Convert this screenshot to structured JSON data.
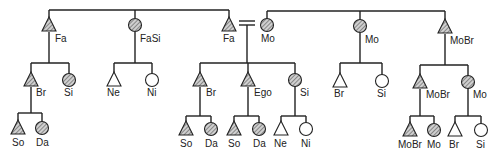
{
  "diagram": {
    "legend": {
      "triangle": "male",
      "circle": "female",
      "hatched": "consanguineal relative",
      "open": "not shaded",
      "equals": "marriage"
    },
    "colors": {
      "line": "#222222",
      "fill_hatch": "#888888",
      "background": "#ffffff"
    },
    "nodes": [
      {
        "id": "fa_left",
        "label": "Fa",
        "shape": "triangle",
        "fill": "hatched",
        "x": 49,
        "y": 25,
        "lx": 55,
        "ly": 42
      },
      {
        "id": "fasi",
        "label": "FaSi",
        "shape": "circle",
        "fill": "hatched",
        "x": 135,
        "y": 25,
        "lx": 140,
        "ly": 42
      },
      {
        "id": "fa_center",
        "label": "Fa",
        "shape": "triangle",
        "fill": "hatched",
        "x": 229,
        "y": 25,
        "lx": 223,
        "ly": 42
      },
      {
        "id": "mo_center",
        "label": "Mo",
        "shape": "circle",
        "fill": "hatched",
        "x": 267,
        "y": 25,
        "lx": 261,
        "ly": 42
      },
      {
        "id": "mo_right",
        "label": "Mo",
        "shape": "circle",
        "fill": "hatched",
        "x": 360,
        "y": 26,
        "lx": 365,
        "ly": 43
      },
      {
        "id": "mobr",
        "label": "MoBr",
        "shape": "triangle",
        "fill": "hatched",
        "x": 445,
        "y": 27,
        "lx": 450,
        "ly": 44
      },
      {
        "id": "br_l",
        "label": "Br",
        "shape": "triangle",
        "fill": "hatched",
        "x": 31,
        "y": 80,
        "lx": 36,
        "ly": 96
      },
      {
        "id": "si_l",
        "label": "Si",
        "shape": "circle",
        "fill": "hatched",
        "x": 69,
        "y": 80,
        "lx": 64,
        "ly": 96
      },
      {
        "id": "ne_fasi",
        "label": "Ne",
        "shape": "triangle",
        "fill": "open",
        "x": 114,
        "y": 80,
        "lx": 107,
        "ly": 96
      },
      {
        "id": "ni_fasi",
        "label": "Ni",
        "shape": "circle",
        "fill": "open",
        "x": 152,
        "y": 80,
        "lx": 147,
        "ly": 96
      },
      {
        "id": "br_c",
        "label": "Br",
        "shape": "triangle",
        "fill": "hatched",
        "x": 200,
        "y": 80,
        "lx": 206,
        "ly": 96
      },
      {
        "id": "ego",
        "label": "Ego",
        "shape": "triangle",
        "fill": "hatched",
        "x": 248,
        "y": 80,
        "lx": 254,
        "ly": 96
      },
      {
        "id": "si_c",
        "label": "Si",
        "shape": "circle",
        "fill": "hatched",
        "x": 295,
        "y": 80,
        "lx": 300,
        "ly": 96
      },
      {
        "id": "br_mo",
        "label": "Br",
        "shape": "triangle",
        "fill": "open",
        "x": 340,
        "y": 81,
        "lx": 334,
        "ly": 97
      },
      {
        "id": "si_mo",
        "label": "Si",
        "shape": "circle",
        "fill": "open",
        "x": 382,
        "y": 81,
        "lx": 377,
        "ly": 97
      },
      {
        "id": "mobr_2",
        "label": "MoBr",
        "shape": "triangle",
        "fill": "hatched",
        "x": 420,
        "y": 82,
        "lx": 426,
        "ly": 98
      },
      {
        "id": "mo_2",
        "label": "Mo",
        "shape": "circle",
        "fill": "hatched",
        "x": 468,
        "y": 82,
        "lx": 473,
        "ly": 98
      },
      {
        "id": "so_l",
        "label": "So",
        "shape": "triangle",
        "fill": "hatched",
        "x": 18,
        "y": 128,
        "lx": 12,
        "ly": 146
      },
      {
        "id": "da_l",
        "label": "Da",
        "shape": "circle",
        "fill": "hatched",
        "x": 42,
        "y": 128,
        "lx": 36,
        "ly": 146
      },
      {
        "id": "so_br",
        "label": "So",
        "shape": "triangle",
        "fill": "hatched",
        "x": 186,
        "y": 129,
        "lx": 180,
        "ly": 147
      },
      {
        "id": "da_br",
        "label": "Da",
        "shape": "circle",
        "fill": "hatched",
        "x": 211,
        "y": 129,
        "lx": 205,
        "ly": 147
      },
      {
        "id": "so_ego",
        "label": "So",
        "shape": "triangle",
        "fill": "hatched",
        "x": 234,
        "y": 129,
        "lx": 228,
        "ly": 147
      },
      {
        "id": "da_ego",
        "label": "Da",
        "shape": "circle",
        "fill": "hatched",
        "x": 259,
        "y": 129,
        "lx": 253,
        "ly": 147
      },
      {
        "id": "ne_si",
        "label": "Ne",
        "shape": "triangle",
        "fill": "open",
        "x": 281,
        "y": 129,
        "lx": 274,
        "ly": 147
      },
      {
        "id": "ni_si",
        "label": "Ni",
        "shape": "circle",
        "fill": "open",
        "x": 306,
        "y": 129,
        "lx": 301,
        "ly": 147
      },
      {
        "id": "mobr_3",
        "label": "MoBr",
        "shape": "triangle",
        "fill": "hatched",
        "x": 410,
        "y": 130,
        "lx": 398,
        "ly": 148
      },
      {
        "id": "mo_3",
        "label": "Mo",
        "shape": "circle",
        "fill": "hatched",
        "x": 434,
        "y": 130,
        "lx": 427,
        "ly": 148
      },
      {
        "id": "br_3",
        "label": "Br",
        "shape": "triangle",
        "fill": "open",
        "x": 455,
        "y": 130,
        "lx": 449,
        "ly": 148
      },
      {
        "id": "si_3",
        "label": "Si",
        "shape": "circle",
        "fill": "open",
        "x": 481,
        "y": 130,
        "lx": 476,
        "ly": 148
      }
    ],
    "lines": [
      [
        49,
        18,
        49,
        10
      ],
      [
        49,
        10,
        229,
        10
      ],
      [
        229,
        10,
        229,
        18
      ],
      [
        135,
        10,
        135,
        18
      ],
      [
        49,
        32,
        49,
        63
      ],
      [
        31,
        63,
        69,
        63
      ],
      [
        31,
        63,
        31,
        73
      ],
      [
        69,
        63,
        69,
        74
      ],
      [
        135,
        32,
        135,
        63
      ],
      [
        114,
        63,
        152,
        63
      ],
      [
        114,
        63,
        114,
        73
      ],
      [
        152,
        63,
        152,
        74
      ],
      [
        239,
        21,
        255,
        21
      ],
      [
        239,
        25,
        255,
        25
      ],
      [
        247,
        25,
        247,
        63
      ],
      [
        200,
        63,
        295,
        63
      ],
      [
        200,
        63,
        200,
        73
      ],
      [
        248,
        63,
        248,
        73
      ],
      [
        295,
        63,
        295,
        74
      ],
      [
        267,
        19,
        267,
        11
      ],
      [
        267,
        11,
        445,
        11
      ],
      [
        360,
        11,
        360,
        20
      ],
      [
        445,
        11,
        445,
        20
      ],
      [
        360,
        33,
        360,
        63
      ],
      [
        340,
        63,
        382,
        63
      ],
      [
        340,
        63,
        340,
        74
      ],
      [
        382,
        63,
        382,
        75
      ],
      [
        445,
        34,
        445,
        65
      ],
      [
        420,
        65,
        468,
        65
      ],
      [
        420,
        65,
        420,
        75
      ],
      [
        468,
        65,
        468,
        76
      ],
      [
        31,
        87,
        31,
        113
      ],
      [
        18,
        113,
        42,
        113
      ],
      [
        18,
        113,
        18,
        121
      ],
      [
        42,
        113,
        42,
        122
      ],
      [
        200,
        87,
        200,
        116
      ],
      [
        186,
        116,
        211,
        116
      ],
      [
        186,
        116,
        186,
        122
      ],
      [
        211,
        116,
        211,
        123
      ],
      [
        248,
        87,
        248,
        116
      ],
      [
        234,
        116,
        259,
        116
      ],
      [
        234,
        116,
        234,
        122
      ],
      [
        259,
        116,
        259,
        123
      ],
      [
        295,
        86,
        295,
        116
      ],
      [
        281,
        116,
        306,
        116
      ],
      [
        281,
        116,
        281,
        122
      ],
      [
        306,
        116,
        306,
        123
      ],
      [
        420,
        89,
        420,
        116
      ],
      [
        410,
        116,
        434,
        116
      ],
      [
        410,
        116,
        410,
        123
      ],
      [
        434,
        116,
        434,
        124
      ],
      [
        468,
        88,
        468,
        116
      ],
      [
        455,
        116,
        481,
        116
      ],
      [
        455,
        116,
        455,
        123
      ],
      [
        481,
        116,
        481,
        124
      ]
    ]
  }
}
